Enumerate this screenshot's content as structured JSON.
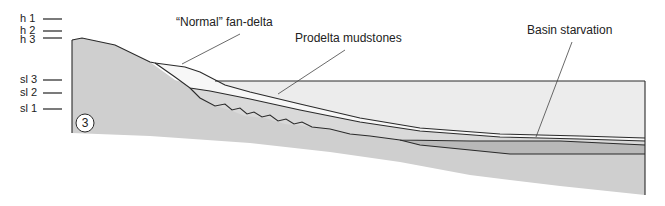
{
  "figure": {
    "panel_number": "3",
    "level_labels": {
      "highstand": [
        "h 1",
        "h 2",
        "h 3"
      ],
      "sea_level": [
        "sl 3",
        "sl 2",
        "sl 1"
      ]
    },
    "annotations": [
      {
        "id": "normal-fan-delta",
        "text": "“Normal” fan-delta"
      },
      {
        "id": "prodelta-mudstones",
        "text": "Prodelta mudstones"
      },
      {
        "id": "basin-starvation",
        "text": "Basin starvation"
      }
    ],
    "colors": {
      "basement": "#cfcfcf",
      "water": "#ececec",
      "fan_delta": "#f7f7f7",
      "prodelta": "#d9d9d9",
      "starved_basin": "#b9b9b9",
      "line": "#2a2a2a"
    }
  }
}
